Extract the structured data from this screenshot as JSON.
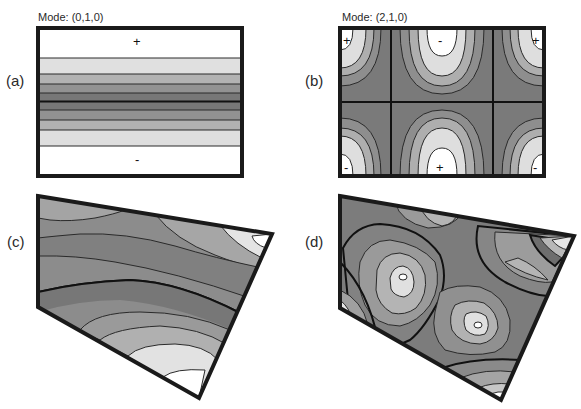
{
  "figure": {
    "panels": [
      {
        "id": "a",
        "label": "(a)",
        "mode_title": "Mode: (0,1,0)",
        "shape": "rectangle",
        "signs": [
          {
            "text": "+",
            "position": "top-center"
          },
          {
            "text": "-",
            "position": "bottom-center"
          }
        ]
      },
      {
        "id": "b",
        "label": "(b)",
        "mode_title": "Mode: (2,1,0)",
        "shape": "rectangle",
        "signs": [
          {
            "text": "+",
            "position": "top-left"
          },
          {
            "text": "-",
            "position": "top-center"
          },
          {
            "text": "+",
            "position": "top-right"
          },
          {
            "text": "-",
            "position": "bottom-left"
          },
          {
            "text": "+",
            "position": "bottom-center"
          },
          {
            "text": "-",
            "position": "bottom-right"
          }
        ]
      },
      {
        "id": "c",
        "label": "(c)",
        "mode_title": "",
        "shape": "quadrilateral"
      },
      {
        "id": "d",
        "label": "(d)",
        "mode_title": "",
        "shape": "quadrilateral"
      }
    ],
    "colors": {
      "level_0": "#ffffff",
      "level_1": "#e2e2e2",
      "level_2": "#b4b4b4",
      "level_3": "#959595",
      "level_4": "#767676",
      "outline": "#1a1a1a"
    }
  }
}
